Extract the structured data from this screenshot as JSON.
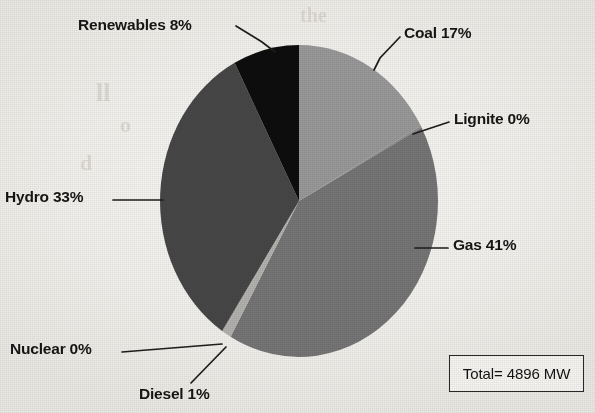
{
  "chart_data": {
    "type": "pie",
    "title": "",
    "labels": [
      "Coal",
      "Lignite",
      "Gas",
      "Diesel",
      "Nuclear",
      "Hydro",
      "Renewables"
    ],
    "values": [
      17,
      0,
      41,
      1,
      0,
      33,
      8
    ],
    "value_unit": "%",
    "legend": "none",
    "slice_label_format": "{name} {value}%",
    "slices": [
      {
        "name": "Coal",
        "percent": 17,
        "label": "Coal 17%",
        "color": "#9a9a9a",
        "start_deg": 0,
        "end_deg": 61.2
      },
      {
        "name": "Lignite",
        "percent": 0,
        "label": "Lignite 0%",
        "color": "#8d8d8d",
        "start_deg": 61.2,
        "end_deg": 61.9
      },
      {
        "name": "Gas",
        "percent": 41,
        "label": "Gas 41%",
        "color": "#767676",
        "start_deg": 61.9,
        "end_deg": 209.5
      },
      {
        "name": "Diesel",
        "percent": 1,
        "label": "Diesel 1%",
        "color": "#b4b2ae",
        "start_deg": 209.5,
        "end_deg": 213.1
      },
      {
        "name": "Nuclear",
        "percent": 0,
        "label": "Nuclear 0%",
        "color": "#a3a3a3",
        "start_deg": 213.1,
        "end_deg": 213.6
      },
      {
        "name": "Hydro",
        "percent": 33,
        "label": "Hydro 33%",
        "color": "#474747",
        "start_deg": 213.6,
        "end_deg": 332.4
      },
      {
        "name": "Renewables",
        "percent": 8,
        "label": "Renewables 8%",
        "color": "#0f0f0f",
        "start_deg": 332.4,
        "end_deg": 360
      }
    ],
    "annotations": [
      {
        "name": "total",
        "text": "Total= 4896 MW",
        "value": 4896,
        "unit": "MW"
      }
    ]
  },
  "labels": {
    "renewables": "Renewables 8%",
    "coal": "Coal 17%",
    "lignite": "Lignite 0%",
    "gas": "Gas 41%",
    "hydro": "Hydro 33%",
    "nuclear": "Nuclear 0%",
    "diesel": "Diesel 1%"
  },
  "total": {
    "text": "Total= 4896 MW"
  },
  "background_text": {
    "line1": "the",
    "line2": "ll",
    "line3": "o",
    "line4": "ne",
    "line5": "d"
  }
}
